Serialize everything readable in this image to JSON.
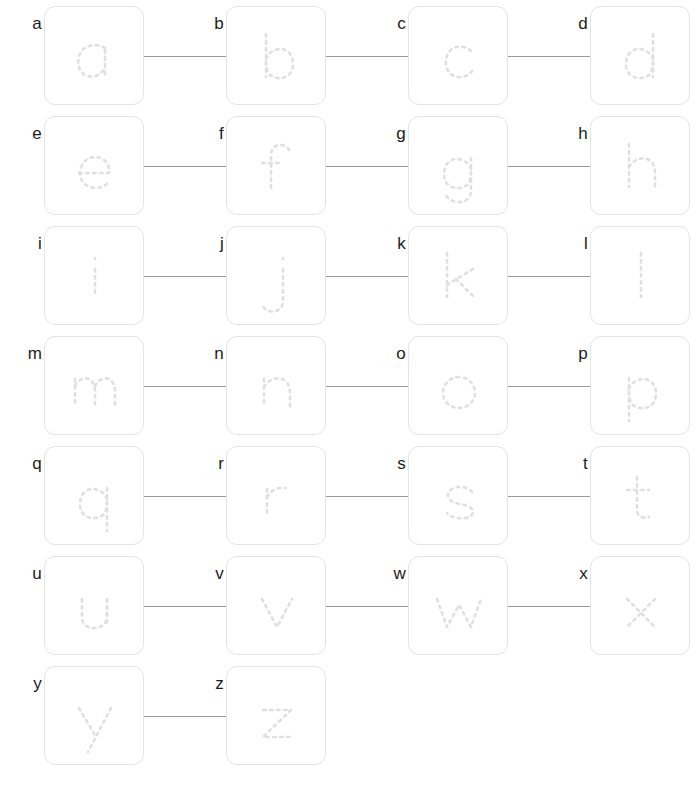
{
  "worksheet": {
    "title": "Lowercase alphabet tracing worksheet",
    "background_color": "#ffffff",
    "box_border_color": "#e4e4e4",
    "trace_stroke_color": "#e0e0e0",
    "connector_color": "#9a9a9a",
    "label_color": "#1c1c1c",
    "columns": 4,
    "rows": 7,
    "box_size_px": 100,
    "column_pitch_px": 182,
    "row_pitch_px": 110,
    "first_box_left_px": 44,
    "first_box_top_px": 6
  },
  "rows": [
    {
      "index": 0,
      "cells": [
        {
          "label": "a",
          "glyph": "a",
          "connector_after": true
        },
        {
          "label": "b",
          "glyph": "b",
          "connector_after": true
        },
        {
          "label": "c",
          "glyph": "c",
          "connector_after": true
        },
        {
          "label": "d",
          "glyph": "d",
          "connector_after": false
        }
      ]
    },
    {
      "index": 1,
      "cells": [
        {
          "label": "e",
          "glyph": "e",
          "connector_after": true
        },
        {
          "label": "f",
          "glyph": "f",
          "connector_after": true
        },
        {
          "label": "g",
          "glyph": "g",
          "connector_after": true
        },
        {
          "label": "h",
          "glyph": "h",
          "connector_after": false
        }
      ]
    },
    {
      "index": 2,
      "cells": [
        {
          "label": "i",
          "glyph": "i",
          "connector_after": true
        },
        {
          "label": "j",
          "glyph": "j",
          "connector_after": true
        },
        {
          "label": "k",
          "glyph": "k",
          "connector_after": true
        },
        {
          "label": "l",
          "glyph": "l",
          "connector_after": false
        }
      ]
    },
    {
      "index": 3,
      "cells": [
        {
          "label": "m",
          "glyph": "m",
          "connector_after": true
        },
        {
          "label": "n",
          "glyph": "n",
          "connector_after": true
        },
        {
          "label": "o",
          "glyph": "o",
          "connector_after": true
        },
        {
          "label": "p",
          "glyph": "p",
          "connector_after": false
        }
      ]
    },
    {
      "index": 4,
      "cells": [
        {
          "label": "q",
          "glyph": "q",
          "connector_after": true
        },
        {
          "label": "r",
          "glyph": "r",
          "connector_after": true
        },
        {
          "label": "s",
          "glyph": "s",
          "connector_after": true
        },
        {
          "label": "t",
          "glyph": "t",
          "connector_after": false
        }
      ]
    },
    {
      "index": 5,
      "cells": [
        {
          "label": "u",
          "glyph": "u",
          "connector_after": true
        },
        {
          "label": "v",
          "glyph": "v",
          "connector_after": true
        },
        {
          "label": "w",
          "glyph": "w",
          "connector_after": true
        },
        {
          "label": "x",
          "glyph": "x",
          "connector_after": false
        }
      ]
    },
    {
      "index": 6,
      "cells": [
        {
          "label": "y",
          "glyph": "y",
          "connector_after": true
        },
        {
          "label": "z",
          "glyph": "z",
          "connector_after": false
        }
      ]
    }
  ]
}
